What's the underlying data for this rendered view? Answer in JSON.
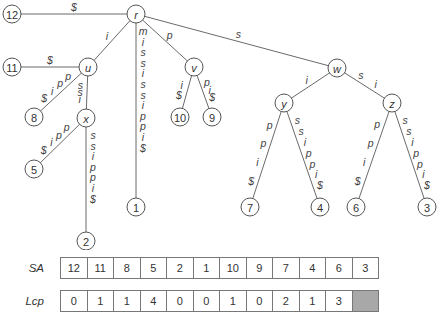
{
  "tree": {
    "nodes": [
      {
        "id": "r",
        "label": "r",
        "x": 136,
        "y": 14,
        "internal": true
      },
      {
        "id": "12",
        "label": "12",
        "x": 12,
        "y": 14,
        "internal": false
      },
      {
        "id": "u",
        "label": "u",
        "x": 88,
        "y": 67,
        "internal": true
      },
      {
        "id": "11",
        "label": "11",
        "x": 12,
        "y": 67,
        "internal": false
      },
      {
        "id": "8",
        "label": "8",
        "x": 34,
        "y": 117,
        "internal": false
      },
      {
        "id": "x",
        "label": "x",
        "x": 86,
        "y": 118,
        "internal": true
      },
      {
        "id": "5",
        "label": "5",
        "x": 34,
        "y": 169,
        "internal": false
      },
      {
        "id": "2",
        "label": "2",
        "x": 86,
        "y": 241,
        "internal": false
      },
      {
        "id": "1",
        "label": "1",
        "x": 136,
        "y": 207,
        "internal": false
      },
      {
        "id": "v",
        "label": "v",
        "x": 194,
        "y": 67,
        "internal": true
      },
      {
        "id": "10",
        "label": "10",
        "x": 180,
        "y": 117,
        "internal": false
      },
      {
        "id": "9",
        "label": "9",
        "x": 212,
        "y": 117,
        "internal": false
      },
      {
        "id": "w",
        "label": "w",
        "x": 337,
        "y": 68,
        "internal": true
      },
      {
        "id": "y",
        "label": "y",
        "x": 284,
        "y": 103,
        "internal": true
      },
      {
        "id": "z",
        "label": "z",
        "x": 392,
        "y": 103,
        "internal": true
      },
      {
        "id": "7",
        "label": "7",
        "x": 250,
        "y": 207,
        "internal": false
      },
      {
        "id": "4",
        "label": "4",
        "x": 320,
        "y": 207,
        "internal": false
      },
      {
        "id": "6",
        "label": "6",
        "x": 356,
        "y": 207,
        "internal": false
      },
      {
        "id": "3",
        "label": "3",
        "x": 427,
        "y": 207,
        "internal": false
      }
    ],
    "edges": [
      {
        "from": "r",
        "to": "12",
        "label": "$"
      },
      {
        "from": "r",
        "to": "u",
        "label": "i"
      },
      {
        "from": "r",
        "to": "1",
        "label": "mississippi$"
      },
      {
        "from": "r",
        "to": "v",
        "label": "p"
      },
      {
        "from": "r",
        "to": "w",
        "label": "s"
      },
      {
        "from": "u",
        "to": "11",
        "label": "$"
      },
      {
        "from": "u",
        "to": "8",
        "label": "ppi$"
      },
      {
        "from": "u",
        "to": "x",
        "label": "ssi"
      },
      {
        "from": "x",
        "to": "5",
        "label": "ppi$"
      },
      {
        "from": "x",
        "to": "2",
        "label": "ssippi$"
      },
      {
        "from": "v",
        "to": "10",
        "label": "i$"
      },
      {
        "from": "v",
        "to": "9",
        "label": "pi$"
      },
      {
        "from": "w",
        "to": "y",
        "label": "i"
      },
      {
        "from": "w",
        "to": "z",
        "label": "si"
      },
      {
        "from": "y",
        "to": "7",
        "label": "ppi$"
      },
      {
        "from": "y",
        "to": "4",
        "label": "ssippi$"
      },
      {
        "from": "z",
        "to": "6",
        "label": "ppi$"
      },
      {
        "from": "z",
        "to": "3",
        "label": "ssippi$"
      }
    ]
  },
  "arrays": {
    "sa": {
      "label": "SA",
      "values": [
        "12",
        "11",
        "8",
        "5",
        "2",
        "1",
        "10",
        "9",
        "7",
        "4",
        "6",
        "3"
      ]
    },
    "lcp": {
      "label": "Lcp",
      "values": [
        "0",
        "1",
        "1",
        "4",
        "0",
        "0",
        "1",
        "0",
        "2",
        "1",
        "3",
        ""
      ]
    }
  }
}
